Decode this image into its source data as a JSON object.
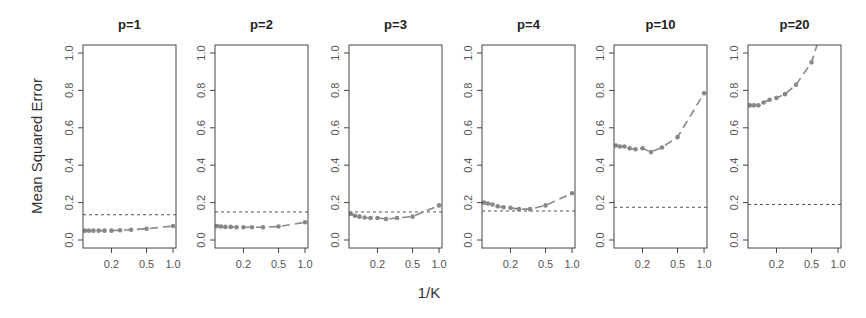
{
  "chart_data": {
    "type": "line",
    "ylabel": "Mean Squared Error",
    "xlabel": "1/K",
    "x_scale": "log",
    "xlim": [
      0.095,
      1.08
    ],
    "ylim": [
      0.0,
      1.0
    ],
    "x_ticks": [
      0.2,
      0.5,
      1.0
    ],
    "x_tick_labels": [
      "0.2",
      "0.5",
      "1.0"
    ],
    "y_ticks": [
      0.0,
      0.2,
      0.4,
      0.6,
      0.8,
      1.0
    ],
    "y_tick_labels": [
      "0.0",
      "0.2",
      "0.4",
      "0.6",
      "0.8",
      "1.0"
    ],
    "x": [
      0.1,
      0.111,
      0.125,
      0.143,
      0.167,
      0.2,
      0.25,
      0.333,
      0.5,
      1.0
    ],
    "series_style": {
      "knn": "grey dashed line with dots",
      "linear_regression": "dotted horizontal reference line"
    },
    "panels": [
      {
        "title": "p=1",
        "knn": [
          0.05,
          0.05,
          0.05,
          0.05,
          0.05,
          0.05,
          0.052,
          0.055,
          0.06,
          0.075
        ],
        "linear_regression": 0.135
      },
      {
        "title": "p=2",
        "knn": [
          0.075,
          0.072,
          0.07,
          0.07,
          0.068,
          0.068,
          0.068,
          0.068,
          0.072,
          0.095
        ],
        "linear_regression": 0.15
      },
      {
        "title": "p=3",
        "knn": [
          0.14,
          0.13,
          0.125,
          0.12,
          0.118,
          0.118,
          0.112,
          0.118,
          0.125,
          0.185
        ],
        "linear_regression": 0.15
      },
      {
        "title": "p=4",
        "knn": [
          0.2,
          0.195,
          0.19,
          0.18,
          0.175,
          0.172,
          0.165,
          0.165,
          0.185,
          0.25
        ],
        "linear_regression": 0.155
      },
      {
        "title": "p=10",
        "knn": [
          0.505,
          0.5,
          0.5,
          0.49,
          0.485,
          0.49,
          0.47,
          0.495,
          0.55,
          0.785
        ],
        "linear_regression": 0.175
      },
      {
        "title": "p=20",
        "knn": [
          0.72,
          0.72,
          0.72,
          0.735,
          0.75,
          0.76,
          0.78,
          0.83,
          0.95,
          1.4
        ],
        "linear_regression": 0.19
      }
    ]
  },
  "layout": {
    "panel_left": [
      83,
      215,
      349,
      482,
      614,
      748
    ],
    "panel_width": 93,
    "box_top": 45,
    "box_bottom": 248,
    "y0_px": 240,
    "y1_px": 53,
    "colors": {
      "knn": "#888888",
      "reference": "#555555",
      "axis": "#444444"
    }
  }
}
